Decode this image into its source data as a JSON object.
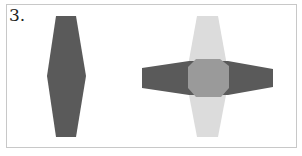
{
  "figure": {
    "label": "3.",
    "colors": {
      "dark_shape": "#5a5a5a",
      "light_shape": "#dcdcdc",
      "overlap": "#9a9a9a",
      "border": "#c8c8c8"
    },
    "shapes": [
      {
        "name": "vertical-hexagon-left",
        "fill": "dark"
      },
      {
        "name": "vertical-hexagon-right",
        "fill": "light"
      },
      {
        "name": "horizontal-hexagon-right",
        "fill": "dark"
      },
      {
        "name": "overlap-region",
        "fill": "medium"
      }
    ]
  }
}
